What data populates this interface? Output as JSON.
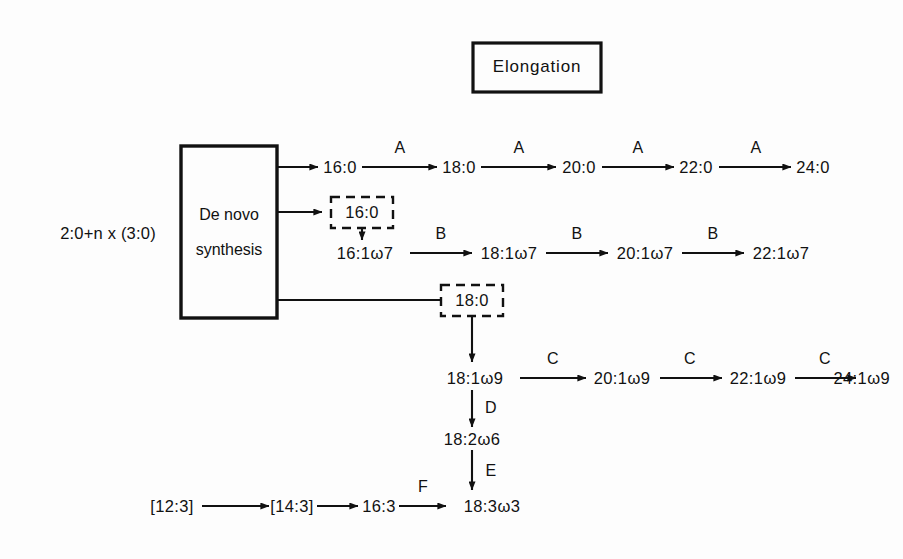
{
  "diagram": {
    "title_box": {
      "label": "Elongation"
    },
    "source": {
      "label": "2:0+n x (3:0)"
    },
    "process_box": {
      "line1": "De novo",
      "line2": "synthesis"
    },
    "intermediate_boxes": [
      {
        "name": "dashed-16-0",
        "label": "16:0"
      },
      {
        "name": "dashed-18-0",
        "label": "18:0"
      }
    ],
    "rows": {
      "saturated": {
        "enzyme": "A",
        "nodes": [
          "16:0",
          "18:0",
          "20:0",
          "22:0",
          "24:0"
        ],
        "enzymes": [
          "A",
          "A",
          "A",
          "A"
        ]
      },
      "omega7": {
        "enzyme": "B",
        "nodes": [
          "16:1ω7",
          "18:1ω7",
          "20:1ω7",
          "22:1ω7"
        ],
        "enzymes": [
          "B",
          "B",
          "B"
        ]
      },
      "omega9": {
        "enzyme": "C",
        "nodes": [
          "18:1ω9",
          "20:1ω9",
          "22:1ω9",
          "24:1ω9"
        ],
        "enzymes": [
          "C",
          "C",
          "C"
        ]
      },
      "desaturation": {
        "nodes": [
          "18:1ω9",
          "18:2ω6",
          "18:3ω3"
        ],
        "enzymes": [
          "D",
          "E"
        ]
      },
      "bottom": {
        "nodes": [
          "[12:3]",
          "[14:3]",
          "16:3",
          "18:3ω3"
        ],
        "enzymes": [
          "",
          "",
          "F"
        ]
      }
    },
    "colors": {
      "ink": "#111111",
      "background": "#fdfdfd"
    }
  }
}
